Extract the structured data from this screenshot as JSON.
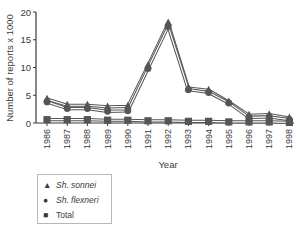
{
  "chart_data": {
    "type": "line",
    "title": "",
    "xlabel": "Year",
    "ylabel": "Number of reports x 1000",
    "ylim": [
      0,
      20
    ],
    "yticks": [
      0,
      5,
      10,
      15,
      20
    ],
    "grid": false,
    "legend_position": "bottom-left, below chart",
    "categories": [
      "1986",
      "1987",
      "1988",
      "1989",
      "1990",
      "1991",
      "1992",
      "1993",
      "1994",
      "1995",
      "1996",
      "1997",
      "1998"
    ],
    "series": [
      {
        "name": "Sh. sonnei",
        "marker": "triangle",
        "italic": true,
        "values": [
          4.3,
          3.2,
          3.2,
          2.9,
          3.0,
          10.3,
          18.0,
          6.3,
          5.9,
          3.8,
          1.4,
          1.5,
          0.9
        ]
      },
      {
        "name": "Sh. flexneri",
        "marker": "circle",
        "italic": true,
        "values": [
          3.8,
          2.6,
          2.6,
          2.1,
          2.2,
          9.8,
          17.4,
          6.0,
          5.5,
          3.6,
          1.0,
          1.1,
          0.6
        ]
      },
      {
        "name": "Total",
        "marker": "square",
        "italic": false,
        "values": [
          0.6,
          0.6,
          0.6,
          0.5,
          0.5,
          0.4,
          0.4,
          0.3,
          0.3,
          0.2,
          0.2,
          0.2,
          0.1
        ]
      }
    ]
  },
  "legend": {
    "items": [
      {
        "label": "Sh. sonnei",
        "symbol": "▲",
        "italic": true
      },
      {
        "label": "Sh. flexneri",
        "symbol": "●",
        "italic": true
      },
      {
        "label": "Total",
        "symbol": "■",
        "italic": false
      }
    ]
  },
  "colors": {
    "series": "#555555",
    "axis": "#3a3a3a",
    "text": "#3a3a3a"
  }
}
